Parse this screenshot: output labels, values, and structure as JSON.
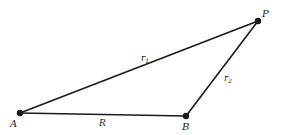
{
  "diagram": {
    "type": "triangle",
    "colors": {
      "stroke": "#1a1a1a",
      "background": "#ffffff"
    },
    "vertices": [
      {
        "id": "A",
        "label": "A",
        "x": 20,
        "y": 113,
        "label_x": 10,
        "label_y": 127
      },
      {
        "id": "B",
        "label": "B",
        "x": 186,
        "y": 116,
        "label_x": 182,
        "label_y": 130
      },
      {
        "id": "P",
        "label": "P",
        "x": 258,
        "y": 21,
        "label_x": 262,
        "label_y": 17
      }
    ],
    "edges": [
      {
        "from": "A",
        "to": "P",
        "label": "r",
        "subscript": "1",
        "label_x": 141,
        "label_y": 61
      },
      {
        "from": "B",
        "to": "P",
        "label": "r",
        "subscript": "2",
        "label_x": 224,
        "label_y": 81
      },
      {
        "from": "A",
        "to": "B",
        "label": "R",
        "subscript": "",
        "label_x": 99,
        "label_y": 126
      }
    ]
  }
}
